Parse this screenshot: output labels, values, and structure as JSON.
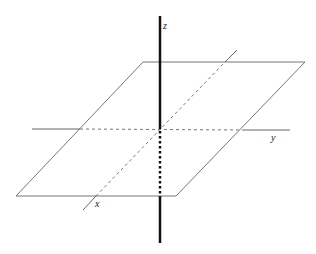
{
  "diagram": {
    "title": "",
    "type": "3d-coordinate-axes-with-plane",
    "labels": {
      "x": "x",
      "y": "y",
      "z": "z"
    },
    "colors": {
      "plane_edge": "#777777",
      "axis_thin": "#666666",
      "axis_z": "#111111",
      "background": "#ffffff"
    },
    "plane": {
      "corners": [
        [
          143,
          62
        ],
        [
          305,
          62
        ],
        [
          176,
          196
        ],
        [
          16,
          196
        ]
      ]
    },
    "axes": {
      "z": {
        "top": [
          160,
          16
        ],
        "bottom": [
          160,
          243
        ],
        "hidden_from": [
          160,
          129
        ],
        "hidden_to": [
          160,
          196
        ]
      },
      "y": {
        "start": [
          32,
          129
        ],
        "end": [
          290,
          130
        ],
        "hidden_from": [
          80,
          129
        ],
        "hidden_to": [
          242,
          130
        ]
      },
      "x": {
        "start": [
          83,
          210
        ],
        "end": [
          237,
          50
        ],
        "hidden_from": [
          96,
          196
        ],
        "hidden_to": [
          225,
          62
        ]
      }
    }
  }
}
